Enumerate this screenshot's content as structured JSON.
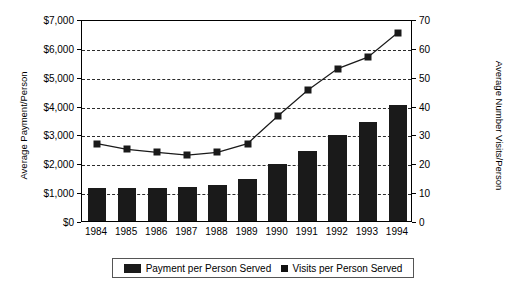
{
  "chart_data": {
    "type": "bar",
    "title": "",
    "categories": [
      "1984",
      "1985",
      "1986",
      "1987",
      "1988",
      "1989",
      "1990",
      "1991",
      "1992",
      "1993",
      "1994"
    ],
    "series": [
      {
        "name": "Payment per Person Served",
        "type": "bar",
        "axis": "left",
        "values": [
          1150,
          1160,
          1150,
          1180,
          1250,
          1440,
          1960,
          2440,
          2990,
          3430,
          4020
        ]
      },
      {
        "name": "Visits per Person Served",
        "type": "line",
        "axis": "right",
        "values": [
          27.5,
          25.5,
          24.5,
          23.5,
          24.5,
          27.5,
          37,
          46,
          53.5,
          57.5,
          66
        ]
      }
    ],
    "xlabel": "",
    "ylabel": "Average Payment/Person",
    "ylabel_right": "Average Number Visits/Person",
    "ylim": [
      0,
      7000
    ],
    "ylim_right": [
      0,
      70
    ],
    "yticks": [
      "$0",
      "$1,000",
      "$2,000",
      "$3,000",
      "$4,000",
      "$5,000",
      "$6,000",
      "$7,000"
    ],
    "ytick_values": [
      0,
      1000,
      2000,
      3000,
      4000,
      5000,
      6000,
      7000
    ],
    "yticks_right": [
      "0",
      "10",
      "20",
      "30",
      "40",
      "50",
      "60",
      "70"
    ],
    "ytick_values_right": [
      0,
      10,
      20,
      30,
      40,
      50,
      60,
      70
    ],
    "grid": true,
    "grid_style": "dashed",
    "legend_position": "bottom",
    "series_color": "#1a1a1a",
    "background_color": "#ffffff"
  },
  "legend": {
    "items": [
      {
        "label": "Payment per Person Served",
        "marker": "bar-swatch"
      },
      {
        "label": "Visits per Person Served",
        "marker": "square-marker"
      }
    ]
  }
}
